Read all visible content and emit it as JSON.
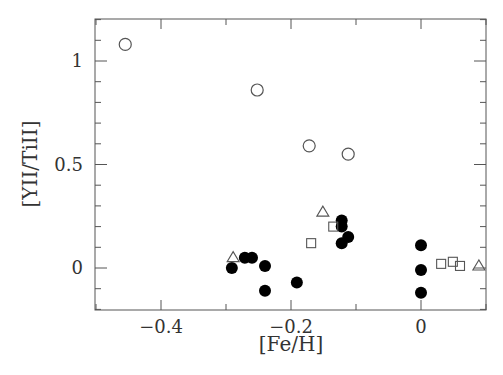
{
  "chart_data": {
    "type": "scatter",
    "title": "",
    "xlabel": "[Fe/H]",
    "ylabel": "[YII/TiII]",
    "xlim": [
      -0.5,
      0.1
    ],
    "ylim": [
      -0.2,
      1.2
    ],
    "xticks": [
      -0.4,
      -0.2,
      0
    ],
    "xtick_labels": [
      "−0.4",
      "−0.2",
      "0"
    ],
    "yticks": [
      0,
      0.5,
      1
    ],
    "ytick_labels": [
      "0",
      "0.5",
      "1"
    ],
    "grid": false,
    "legend": null,
    "series": [
      {
        "name": "open circles",
        "marker": "open-circle",
        "points": [
          {
            "x": -0.455,
            "y": 1.08
          },
          {
            "x": -0.252,
            "y": 0.86
          },
          {
            "x": -0.172,
            "y": 0.59
          },
          {
            "x": -0.112,
            "y": 0.55
          }
        ]
      },
      {
        "name": "filled circles",
        "marker": "filled-circle",
        "points": [
          {
            "x": -0.291,
            "y": 0.0
          },
          {
            "x": -0.271,
            "y": 0.05
          },
          {
            "x": -0.26,
            "y": 0.05
          },
          {
            "x": -0.24,
            "y": 0.01
          },
          {
            "x": -0.24,
            "y": -0.11
          },
          {
            "x": -0.191,
            "y": -0.07
          },
          {
            "x": -0.122,
            "y": 0.23
          },
          {
            "x": -0.122,
            "y": 0.2
          },
          {
            "x": -0.112,
            "y": 0.15
          },
          {
            "x": -0.122,
            "y": 0.12
          },
          {
            "x": 0.0,
            "y": 0.11
          },
          {
            "x": 0.0,
            "y": -0.01
          },
          {
            "x": 0.0,
            "y": -0.12
          }
        ]
      },
      {
        "name": "open squares",
        "marker": "open-square",
        "points": [
          {
            "x": -0.169,
            "y": 0.12
          },
          {
            "x": -0.135,
            "y": 0.2
          },
          {
            "x": 0.031,
            "y": 0.02
          },
          {
            "x": 0.049,
            "y": 0.03
          },
          {
            "x": 0.06,
            "y": 0.01
          }
        ]
      },
      {
        "name": "open triangles",
        "marker": "open-triangle",
        "points": [
          {
            "x": -0.289,
            "y": 0.05
          },
          {
            "x": -0.151,
            "y": 0.27
          },
          {
            "x": 0.089,
            "y": 0.01
          }
        ]
      }
    ]
  }
}
